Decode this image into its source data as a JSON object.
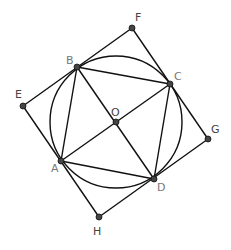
{
  "diagram": {
    "points": {
      "A": {
        "label": "A",
        "x": 61,
        "y": 161
      },
      "B": {
        "label": "B",
        "x": 77,
        "y": 67
      },
      "C": {
        "label": "C",
        "x": 170,
        "y": 84
      },
      "D": {
        "label": "D",
        "x": 154,
        "y": 179
      },
      "O": {
        "label": "O",
        "x": 116,
        "y": 122
      },
      "E": {
        "label": "E",
        "x": 23,
        "y": 106
      },
      "F": {
        "label": "F",
        "x": 132,
        "y": 28
      },
      "G": {
        "label": "G",
        "x": 208,
        "y": 139
      },
      "H": {
        "label": "H",
        "x": 99,
        "y": 217
      }
    },
    "circle": {
      "center": "O",
      "radius": 66
    },
    "segments": [
      "AB",
      "BC",
      "CD",
      "DA",
      "AC",
      "BD",
      "EF",
      "FG",
      "GH",
      "HE"
    ],
    "colors": {
      "line": "#111111",
      "point": "#333333",
      "label": "#555555"
    }
  }
}
